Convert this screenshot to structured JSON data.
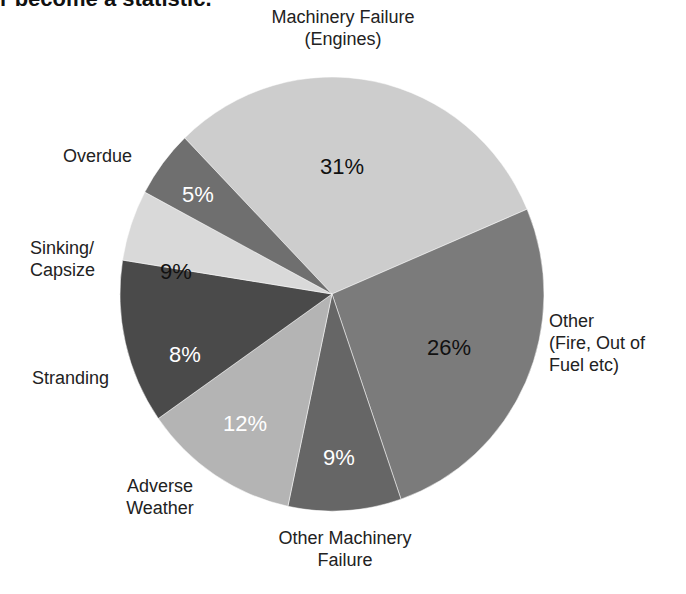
{
  "header": {
    "title": "r become a statistic."
  },
  "chart_data": {
    "type": "pie",
    "title": "",
    "categories": [
      "Machinery Failure (Engines)",
      "Other (Fire, Out of Fuel etc)",
      "Other Machinery Failure",
      "Adverse Weather",
      "Stranding",
      "Sinking/ Capsize",
      "Overdue"
    ],
    "values": [
      31,
      26,
      9,
      12,
      8,
      9,
      5
    ],
    "value_labels": [
      "31%",
      "26%",
      "9%",
      "12%",
      "8%",
      "9%",
      "5%"
    ],
    "colors": [
      "#cdcdcd",
      "#7b7b7b",
      "#666666",
      "#b4b4b4",
      "#4a4a4a",
      "#d9d9d9",
      "#6f6f6f"
    ],
    "label_colors": [
      "#111111",
      "#111111",
      "#ffffff",
      "#ffffff",
      "#ffffff",
      "#111111",
      "#ffffff"
    ],
    "slice_angles": [
      226,
      337,
      431,
      462,
      505,
      549,
      568,
      586
    ],
    "legend": "none (direct labels)"
  },
  "labels": [
    {
      "text": "Machinery Failure\n(Engines)",
      "x": 248,
      "y": 6,
      "align": "center",
      "w": 190
    },
    {
      "text": "Other\n(Fire, Out of\nFuel etc)",
      "x": 549,
      "y": 310,
      "align": "left",
      "w": 130
    },
    {
      "text": "Other Machinery\nFailure",
      "x": 250,
      "y": 527,
      "align": "center",
      "w": 190
    },
    {
      "text": "Adverse\nWeather",
      "x": 110,
      "y": 475,
      "align": "center",
      "w": 100
    },
    {
      "text": "Stranding",
      "x": 32,
      "y": 367,
      "align": "left",
      "w": 110
    },
    {
      "text": "Sinking/\nCapsize",
      "x": 30,
      "y": 237,
      "align": "left",
      "w": 110
    },
    {
      "text": "Overdue",
      "x": 63,
      "y": 145,
      "align": "left",
      "w": 100
    }
  ],
  "pct_positions": [
    {
      "x": 320,
      "y": 156
    },
    {
      "x": 427,
      "y": 337
    },
    {
      "x": 323,
      "y": 447
    },
    {
      "x": 223,
      "y": 413
    },
    {
      "x": 169,
      "y": 344
    },
    {
      "x": 160,
      "y": 261
    },
    {
      "x": 182,
      "y": 184
    }
  ]
}
